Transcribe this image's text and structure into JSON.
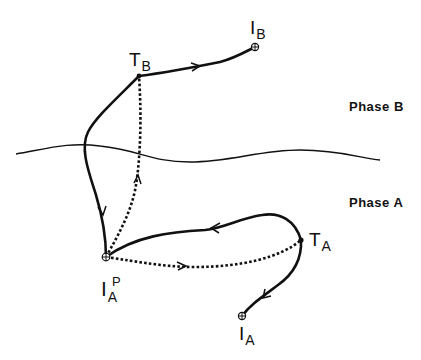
{
  "diagram": {
    "type": "phase-transition-path",
    "regions": [
      {
        "id": "phase-b",
        "label": "Phase B"
      },
      {
        "id": "phase-a",
        "label": "Phase A"
      }
    ],
    "points": [
      {
        "id": "IB",
        "main": "I",
        "sub": "B",
        "marker": "circle-plus",
        "x": 255,
        "y": 47
      },
      {
        "id": "TB",
        "main": "T",
        "sub": "B",
        "marker": "dot",
        "x": 139,
        "y": 76
      },
      {
        "id": "IAP",
        "main": "I",
        "sub": "A",
        "sup": "P",
        "marker": "circle-plus",
        "x": 106,
        "y": 257
      },
      {
        "id": "TA",
        "main": "T",
        "sub": "A",
        "marker": "dot",
        "x": 301,
        "y": 240
      },
      {
        "id": "IA",
        "main": "I",
        "sub": "A",
        "marker": "circle-plus",
        "x": 242,
        "y": 316
      }
    ],
    "paths": [
      {
        "from": "IA",
        "to": "TA",
        "style": "solid",
        "direction": "IA->TA (arrow points toward IA)"
      },
      {
        "from": "TA",
        "to": "IAP",
        "style": "solid"
      },
      {
        "from": "IAP",
        "to": "TA",
        "style": "dotted"
      },
      {
        "from": "IAP",
        "to": "TB",
        "style": "dotted"
      },
      {
        "from": "TB",
        "to": "IAP",
        "style": "solid"
      },
      {
        "from": "TB",
        "to": "IB",
        "style": "solid"
      }
    ],
    "colors": {
      "line": "#111111",
      "background": "#ffffff"
    }
  }
}
